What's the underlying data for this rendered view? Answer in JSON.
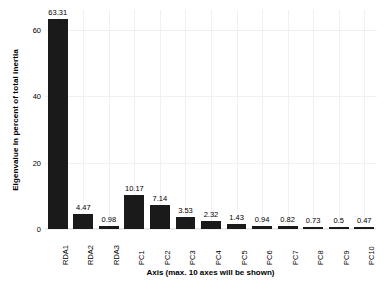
{
  "chart_data": {
    "type": "bar",
    "title": "",
    "subtitle": "",
    "xlabel": "Axis (max. 10 axes will be shown)",
    "ylabel": "Eigenvalue in percent of total inertia",
    "categories": [
      "RDA1",
      "RDA2",
      "RDA3",
      "PC1",
      "PC2",
      "PC3",
      "PC4",
      "PC5",
      "PC6",
      "PC7",
      "PC8",
      "PC9",
      "PC10"
    ],
    "values": [
      63.31,
      4.47,
      0.98,
      10.17,
      7.14,
      3.53,
      2.32,
      1.43,
      0.94,
      0.82,
      0.73,
      0.5,
      0.47
    ],
    "value_labels": [
      "63.31",
      "4.47",
      "0.98",
      "10.17",
      "7.14",
      "3.53",
      "2.32",
      "1.43",
      "0.94",
      "0.82",
      "0.73",
      "0.5",
      "0.47"
    ],
    "ylim": [
      0,
      66
    ],
    "yticks": [
      0,
      20,
      40,
      60
    ],
    "ytick_labels": [
      "0",
      "20",
      "40",
      "60"
    ],
    "grid": true,
    "legend": null,
    "bar_color": "#1a1a1a",
    "grid_color": "#f0f0f0",
    "background_color": "#ffffff"
  },
  "axes": {
    "y_title": "Eigenvalue in percent of total inertia",
    "x_title": "Axis (max. 10 axes will be shown)"
  }
}
